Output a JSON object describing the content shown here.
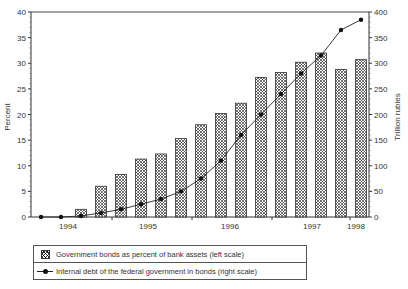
{
  "chart_data": {
    "type": "bar",
    "title": "",
    "xlabel": "",
    "ylabel": "Percent",
    "y2label": "Trillion rubles",
    "ylim": [
      0,
      40
    ],
    "y2lim": [
      0,
      400
    ],
    "yticks": [
      0,
      5,
      10,
      15,
      20,
      25,
      30,
      35,
      40
    ],
    "y2ticks": [
      0,
      50,
      100,
      150,
      200,
      250,
      300,
      350,
      400
    ],
    "xtick_labels": [
      "1994",
      "1995",
      "1996",
      "1997",
      "1998"
    ],
    "grid": false,
    "legend_position": "bottom",
    "series": [
      {
        "name": "Government bonds as percent of bank assets (left scale)",
        "type": "bar",
        "axis": "left",
        "x": [
          3,
          4,
          5,
          6,
          7,
          8,
          9,
          10,
          11,
          12,
          13,
          14,
          15,
          16,
          17
        ],
        "values": [
          1.5,
          6.0,
          8.3,
          11.3,
          12.3,
          15.3,
          18.0,
          20.2,
          22.2,
          27.2,
          28.2,
          30.2,
          32.0,
          28.8,
          30.7
        ]
      },
      {
        "name": "Internal debt of the federal government in bonds (right scale)",
        "type": "line",
        "axis": "right",
        "x": [
          1,
          2,
          3,
          4,
          5,
          6,
          7,
          8,
          9,
          10,
          11,
          12,
          13,
          14,
          15,
          16,
          17
        ],
        "values": [
          0,
          0,
          2,
          8,
          15,
          25,
          35,
          50,
          75,
          110,
          160,
          200,
          240,
          280,
          315,
          365,
          385
        ]
      }
    ]
  },
  "axes": {
    "left_title": "Percent",
    "right_title": "Trillion rubles",
    "left_ticks": [
      "0",
      "5",
      "10",
      "15",
      "20",
      "25",
      "30",
      "35",
      "40"
    ],
    "right_ticks": [
      "0",
      "50",
      "100",
      "150",
      "200",
      "250",
      "300",
      "350",
      "400"
    ],
    "x_labels": [
      "1994",
      "1995",
      "1996",
      "1997",
      "1998"
    ]
  },
  "legend": {
    "bar_label": "Government bonds as percent of bank assets (left scale)",
    "line_label": "Internal debt of the federal government in bonds (right scale)"
  },
  "colors": {
    "axis": "#333333",
    "bar_hatch": "#333333",
    "line": "#222222",
    "marker": "#111111"
  }
}
